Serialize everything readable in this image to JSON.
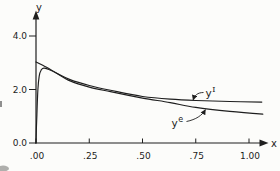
{
  "chart_data": {
    "type": "line",
    "title": "",
    "xlabel": "x",
    "ylabel": "y",
    "xlim": [
      0,
      1.08
    ],
    "ylim": [
      0,
      4.4
    ],
    "grid": false,
    "legend_position": "inline-annotations",
    "x_ticks": {
      "values": [
        0,
        0.25,
        0.5,
        0.75,
        1.0
      ],
      "labels": [
        ".00",
        ".25",
        ".50",
        ".75",
        "1.00"
      ]
    },
    "y_ticks": {
      "values": [
        0,
        2,
        4
      ],
      "labels": [
        "0.0",
        "2.0",
        "4.0"
      ]
    },
    "series": [
      {
        "name": "y-I-approximation",
        "label_base": "y",
        "label_sup": "I",
        "x": [
          0,
          0.05,
          0.1,
          0.16,
          0.25,
          0.35,
          0.5,
          0.63,
          0.75,
          0.91,
          1.06
        ],
        "y": [
          3.03,
          2.83,
          2.6,
          2.37,
          2.15,
          1.97,
          1.74,
          1.64,
          1.59,
          1.55,
          1.53
        ]
      },
      {
        "name": "y-e-exact-solution",
        "label_base": "y",
        "label_sup": "e",
        "x": [
          0,
          0.004,
          0.009,
          0.015,
          0.024,
          0.04,
          0.09,
          0.16,
          0.25,
          0.35,
          0.5,
          0.63,
          0.75,
          0.91,
          1.065
        ],
        "y": [
          0,
          1.05,
          2.0,
          2.5,
          2.72,
          2.8,
          2.64,
          2.32,
          2.09,
          1.92,
          1.68,
          1.51,
          1.33,
          1.18,
          1.08
        ]
      }
    ]
  }
}
